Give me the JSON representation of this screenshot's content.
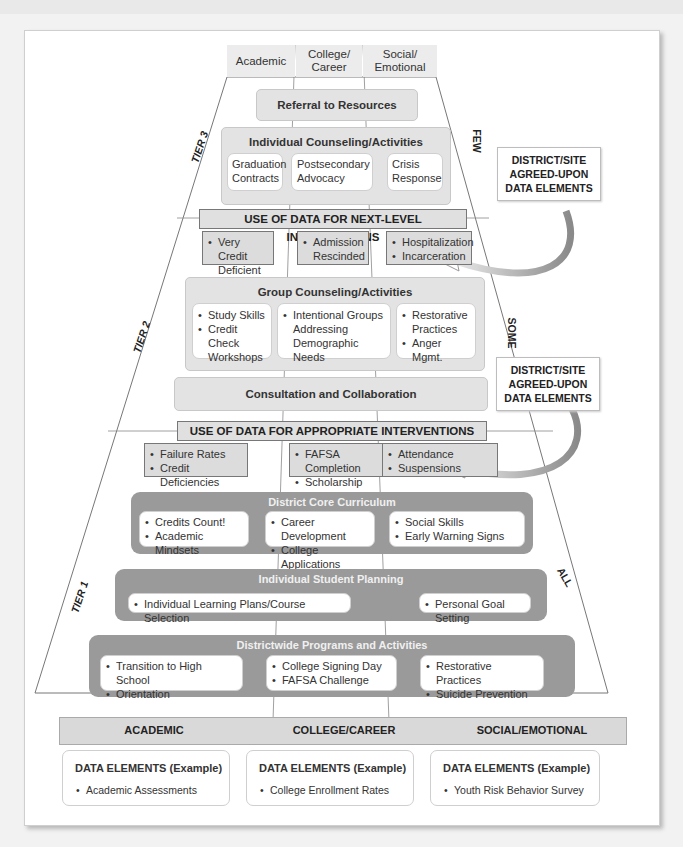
{
  "columns_top": [
    "Academic",
    "College/\nCareer",
    "Social/\nEmotional"
  ],
  "tiers": {
    "tier3": "TIER 3",
    "tier2": "TIER 2",
    "tier1": "TIER 1"
  },
  "reach": {
    "few": "FEW",
    "some": "SOME",
    "all": "ALL"
  },
  "tier3": {
    "referral": "Referral to Resources",
    "individual_counseling": {
      "title": "Individual Counseling/Activities",
      "items": [
        "Graduation Contracts",
        "Postsecondary Advocacy",
        "Crisis Response"
      ]
    },
    "data_bar": "USE OF DATA FOR NEXT-LEVEL INTERVENTIONS",
    "data_cells": [
      [
        "Very Credit Deficient"
      ],
      [
        "Admission Rescinded"
      ],
      [
        "Hospitalization",
        "Incarceration"
      ]
    ]
  },
  "tier2": {
    "group_counseling": {
      "title": "Group Counseling/Activities",
      "columns": [
        [
          "Study Skills",
          "Credit Check Workshops"
        ],
        [
          "Intentional Groups Addressing Demographic Needs"
        ],
        [
          "Restorative Practices",
          "Anger Mgmt."
        ]
      ]
    },
    "consultation": "Consultation and Collaboration",
    "data_bar": "USE OF DATA FOR APPROPRIATE INTERVENTIONS",
    "data_cells": [
      [
        "Failure Rates",
        "Credit Deficiencies"
      ],
      [
        "FAFSA Completion",
        "Scholarship Apps"
      ],
      [
        "Attendance",
        "Suspensions"
      ]
    ]
  },
  "tier1": {
    "core_curriculum": {
      "title": "District Core Curriculum",
      "columns": [
        [
          "Credits Count!",
          "Academic Mindsets"
        ],
        [
          "Career Development",
          "College Applications"
        ],
        [
          "Social Skills",
          "Early Warning Signs"
        ]
      ]
    },
    "student_planning": {
      "title": "Individual Student Planning",
      "columns": [
        [
          "Individual Learning Plans/Course Selection"
        ],
        [
          "Personal Goal Setting"
        ]
      ]
    },
    "districtwide": {
      "title": "Districtwide Programs and Activities",
      "columns": [
        [
          "Transition to High School",
          "Orientation"
        ],
        [
          "College Signing Day",
          "FAFSA Challenge"
        ],
        [
          "Restorative Practices",
          "Suicide Prevention"
        ]
      ]
    }
  },
  "callouts": [
    "DISTRICT/SITE\nAGREED-UPON\nDATA ELEMENTS",
    "DISTRICT/SITE\nAGREED-UPON\nDATA ELEMENTS"
  ],
  "domains": [
    "ACADEMIC",
    "COLLEGE/CAREER",
    "SOCIAL/EMOTIONAL"
  ],
  "data_elements": [
    {
      "title": "DATA ELEMENTS (Example)",
      "item": "Academic Assessments"
    },
    {
      "title": "DATA ELEMENTS (Example)",
      "item": "College Enrollment Rates"
    },
    {
      "title": "DATA ELEMENTS (Example)",
      "item": "Youth Risk Behavior Survey"
    }
  ],
  "colors": {
    "light_box": "#e3e3e3",
    "dark_box": "#9a9a9a",
    "data_cell": "#dcdcdc",
    "domain_bar": "#d9d9d9"
  }
}
